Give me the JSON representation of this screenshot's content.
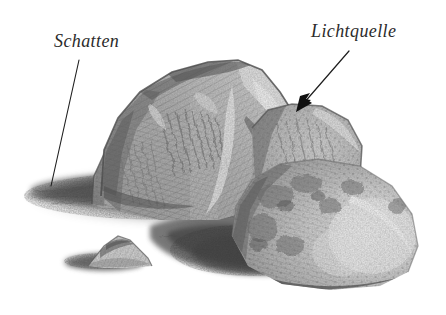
{
  "canvas": {
    "width": 446,
    "height": 315,
    "background_color": "#ffffff",
    "medium": "graphite pencil drawing",
    "subject": "still life study of a group of rocks lit from the upper right"
  },
  "annotations": [
    {
      "id": "schatten",
      "label": "Schatten",
      "style": "italic-serif",
      "color": "#2b2b2b",
      "font_size": 18,
      "text_position": {
        "x": 54,
        "y": 31
      },
      "leader": {
        "type": "line",
        "arrowhead": false,
        "from": {
          "x": 79,
          "y": 60
        },
        "to": {
          "x": 51,
          "y": 186
        }
      },
      "points_at": "cast shadow on the ground at the left of the rocks"
    },
    {
      "id": "lichtquelle",
      "label": "Lichtquelle",
      "style": "italic-serif",
      "color": "#2b2b2b",
      "font_size": 18,
      "text_position": {
        "x": 311,
        "y": 21
      },
      "leader": {
        "type": "arrow",
        "arrowhead": true,
        "from": {
          "x": 349,
          "y": 51
        },
        "to": {
          "x": 296,
          "y": 112
        }
      },
      "points_at": "brightly lit upper right facet of the main rock"
    }
  ],
  "scene_objects": [
    {
      "name": "main-rock",
      "description": "large faceted boulder at centre with hatched shading",
      "bounds": {
        "x": 98,
        "y": 60,
        "width": 200,
        "height": 160
      }
    },
    {
      "name": "left-rock",
      "description": "small rock wedge left of the main boulder",
      "bounds": {
        "x": 92,
        "y": 146,
        "width": 48,
        "height": 58
      }
    },
    {
      "name": "middle-rock",
      "description": "rounded rock lobe right of centre",
      "bounds": {
        "x": 252,
        "y": 104,
        "width": 112,
        "height": 108
      }
    },
    {
      "name": "right-rock",
      "description": "rounded boulder in front at the right, lit on its right side",
      "bounds": {
        "x": 232,
        "y": 160,
        "width": 190,
        "height": 130
      }
    },
    {
      "name": "pebble",
      "description": "small triangular pebble in the left foreground",
      "bounds": {
        "x": 88,
        "y": 234,
        "width": 64,
        "height": 32
      }
    },
    {
      "name": "cast-shadow",
      "description": "long soft shadow cast to the left and front of the rock group",
      "bounds": {
        "x": 24,
        "y": 158,
        "width": 330,
        "height": 120
      }
    },
    {
      "name": "pebble-shadow",
      "description": "small shadow cast to the left of the pebble",
      "bounds": {
        "x": 66,
        "y": 248,
        "width": 72,
        "height": 22
      }
    }
  ],
  "palette": {
    "paper": "#ffffff",
    "ink": "#2b2b2b",
    "graphite_light": "#cfcfcf",
    "graphite_mid": "#9a9a9a",
    "graphite_dark": "#5f5f5f",
    "graphite_darkest": "#3a3a3a"
  }
}
